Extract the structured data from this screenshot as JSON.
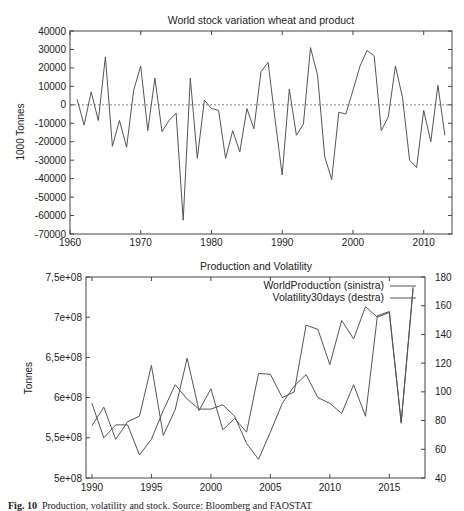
{
  "figure": {
    "caption_label": "Fig. 10",
    "caption_text": "Production, volatility and stock. Source: Bloomberg and FAOSTAT"
  },
  "chart_data": [
    {
      "type": "line",
      "title": "World stock variation wheat and product",
      "xlabel": "",
      "ylabel": "1000 Tonnes",
      "xlim": [
        1960,
        2014
      ],
      "ylim": [
        -70000,
        40000
      ],
      "x_ticks": [
        1960,
        1970,
        1980,
        1990,
        2000,
        2010
      ],
      "y_ticks": [
        40000,
        30000,
        20000,
        10000,
        0,
        -10000,
        -20000,
        -30000,
        -40000,
        -50000,
        -60000,
        -70000
      ],
      "reference_line": {
        "y": 0,
        "style": "dotted"
      },
      "grid": false,
      "x": [
        1961,
        1962,
        1963,
        1964,
        1965,
        1966,
        1967,
        1968,
        1969,
        1970,
        1971,
        1972,
        1973,
        1974,
        1975,
        1976,
        1977,
        1978,
        1979,
        1980,
        1981,
        1982,
        1983,
        1984,
        1985,
        1986,
        1987,
        1988,
        1989,
        1990,
        1991,
        1992,
        1993,
        1994,
        1995,
        1996,
        1997,
        1998,
        1999,
        2000,
        2001,
        2002,
        2003,
        2004,
        2005,
        2006,
        2007,
        2008,
        2009,
        2010,
        2011,
        2012,
        2013
      ],
      "series": [
        {
          "name": "World stock variation",
          "values": [
            3000,
            -11000,
            7000,
            -8500,
            26000,
            -22500,
            -8500,
            -23000,
            8000,
            21000,
            -14000,
            14500,
            -14500,
            -8500,
            -4500,
            -62500,
            14500,
            -29000,
            2500,
            -2000,
            -3000,
            -29000,
            -14000,
            -25500,
            -2000,
            -13000,
            18000,
            23000,
            -8000,
            -38000,
            8500,
            -16500,
            -10500,
            31000,
            16000,
            -28000,
            -40500,
            -4000,
            -5000,
            8000,
            21000,
            29500,
            26500,
            -14000,
            -6500,
            21000,
            4000,
            -30000,
            -34000,
            -3000,
            -20000,
            10500,
            -16500
          ]
        }
      ]
    },
    {
      "type": "line",
      "title": "Production and Volatility",
      "xlabel": "",
      "ylabel": "Tonnes",
      "ylabel_right": "",
      "xlim": [
        1989.5,
        2018
      ],
      "ylim": [
        500000000,
        750000000
      ],
      "ylim_right": [
        40,
        180
      ],
      "x_ticks": [
        1990,
        1995,
        2000,
        2005,
        2010,
        2015
      ],
      "y_ticks": [
        "5e+08",
        "5,5e+08",
        "6e+08",
        "6,5e+08",
        "7e+08",
        "7,5e+08"
      ],
      "y_ticks_right": [
        40,
        60,
        80,
        100,
        120,
        140,
        160,
        180
      ],
      "legend_position": "top-right",
      "grid": false,
      "x": [
        1990,
        1991,
        1992,
        1993,
        1994,
        1995,
        1996,
        1997,
        1998,
        1999,
        2000,
        2001,
        2002,
        2003,
        2004,
        2005,
        2006,
        2007,
        2008,
        2009,
        2010,
        2011,
        2012,
        2013,
        2014,
        2015,
        2016,
        2017
      ],
      "series": [
        {
          "name": "WorldProduction (sinistra)",
          "axis": "left",
          "values": [
            565000000,
            588000000,
            548000000,
            570000000,
            577000000,
            640000000,
            553000000,
            585000000,
            649000000,
            584000000,
            611000000,
            560000000,
            574000000,
            557000000,
            630000000,
            629000000,
            600000000,
            607000000,
            690000000,
            685000000,
            641000000,
            696000000,
            673000000,
            713000000,
            700000000,
            706000000,
            568000000,
            735000000
          ]
        },
        {
          "name": "Volatility30days (destra)",
          "axis": "right",
          "values": [
            92,
            68,
            77,
            77,
            56,
            67,
            87,
            105,
            95,
            88,
            88,
            91,
            83,
            64,
            53,
            72,
            92,
            104,
            112,
            96,
            92,
            85,
            105,
            83,
            153,
            156,
            79,
            173
          ]
        }
      ]
    }
  ]
}
